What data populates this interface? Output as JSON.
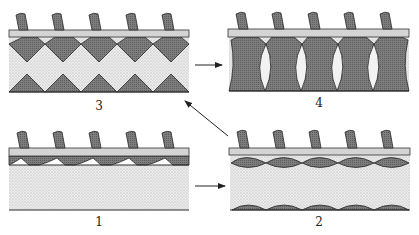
{
  "diagram": {
    "type": "four-stage schematic",
    "colors": {
      "dark_fill": "#7a7a7a",
      "light_stipple": "#e6e6e6",
      "bar_fill": "#cfcfcf",
      "outline": "#2a2a2a",
      "background": "#ffffff"
    },
    "panels": [
      {
        "id": "1",
        "label": "1",
        "description": "Thin row of dark scalloped cells under bar; large stippled region below"
      },
      {
        "id": "2",
        "label": "2",
        "description": "Lens-shaped dark cells under bar and small dark caps on bottom line"
      },
      {
        "id": "3",
        "label": "3",
        "description": "Interlocking dark diamonds top and bottom with stippled diamonds between"
      },
      {
        "id": "4",
        "label": "4",
        "description": "Tall dark hourglass columns with light lens gaps between"
      }
    ],
    "arrows": [
      {
        "from": "1",
        "to": "2"
      },
      {
        "from": "2",
        "to": "3"
      },
      {
        "from": "3",
        "to": "4"
      }
    ],
    "stalks_per_panel": 5
  }
}
